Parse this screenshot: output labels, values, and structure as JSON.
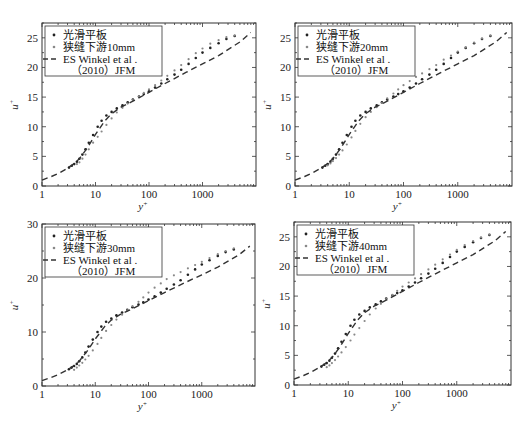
{
  "chart_data": [
    {
      "type": "scatter",
      "panel": "top-left",
      "xlabel": "y+",
      "ylabel": "u+",
      "xscale": "log",
      "xlim": [
        1,
        10000
      ],
      "ylim": [
        0,
        27.5
      ],
      "xticks": [
        "1",
        "10",
        "100",
        "1000"
      ],
      "yticks": [
        "0",
        "5",
        "10",
        "15",
        "20",
        "25"
      ],
      "legend": [
        "光滑平板",
        "狭缝下游10mm",
        "ES Winkel et al .",
        "（2010）JFM"
      ],
      "series": [
        {
          "name": "光滑平板",
          "style": "dark-dots",
          "x": [
            3.2,
            3.6,
            4,
            4.5,
            5,
            5.7,
            6.5,
            7.5,
            9,
            11,
            13,
            16,
            20,
            25,
            32,
            40,
            50,
            65,
            80,
            100,
            130,
            170,
            220,
            300,
            400,
            550,
            750,
            1000,
            1400,
            2000,
            2800,
            4000
          ],
          "y": [
            3.1,
            3.4,
            3.7,
            4.1,
            4.6,
            5.3,
            6.2,
            7.3,
            8.6,
            10.0,
            11.0,
            11.9,
            12.5,
            13.1,
            13.6,
            14.1,
            14.6,
            15.1,
            15.5,
            16.0,
            16.6,
            17.3,
            18.0,
            18.8,
            19.6,
            20.6,
            21.6,
            22.5,
            23.3,
            24.1,
            24.8,
            25.3
          ]
        },
        {
          "name": "狭缝下游10mm",
          "style": "gray-dots",
          "x": [
            4.5,
            5,
            5.7,
            6.5,
            7.5,
            9,
            11,
            13,
            16,
            20,
            25,
            32,
            40,
            50,
            65,
            80,
            100,
            130,
            170,
            220,
            300,
            400,
            550,
            750,
            1000,
            1400,
            2000,
            2800,
            4000
          ],
          "y": [
            3.7,
            4.0,
            4.6,
            5.3,
            6.2,
            7.3,
            8.3,
            9.2,
            10.3,
            11.4,
            12.4,
            13.2,
            13.9,
            14.5,
            15.1,
            15.7,
            16.3,
            17.0,
            17.8,
            18.6,
            19.5,
            20.4,
            21.4,
            22.4,
            23.2,
            24.0,
            24.6,
            25.1,
            25.4
          ]
        },
        {
          "name": "ES Winkel et al. (2010) JFM",
          "style": "dashed",
          "x": [
            1,
            1.5,
            2,
            3,
            4,
            5,
            7,
            10,
            15,
            20,
            30,
            50,
            100,
            200,
            500,
            1000,
            2000,
            5000,
            8000
          ],
          "y": [
            1.0,
            1.6,
            2.1,
            3.0,
            3.8,
            4.6,
            6.4,
            8.7,
            11.0,
            12.2,
            13.3,
            14.3,
            15.8,
            17.3,
            19.2,
            20.6,
            22.0,
            24.3,
            25.9
          ]
        }
      ]
    },
    {
      "type": "scatter",
      "panel": "top-right",
      "xlabel": "y+",
      "ylabel": "u+",
      "xscale": "log",
      "xlim": [
        1,
        10000
      ],
      "ylim": [
        0,
        27.5
      ],
      "xticks": [
        "1",
        "10",
        "100",
        "1000"
      ],
      "yticks": [
        "0",
        "5",
        "10",
        "15",
        "20",
        "25"
      ],
      "legend": [
        "光滑平板",
        "狭缝下游20mm",
        "ES Winkel et al .",
        "（2010）JFM"
      ],
      "series": [
        {
          "name": "光滑平板",
          "style": "dark-dots",
          "x": [
            3.2,
            3.6,
            4,
            4.5,
            5,
            5.7,
            6.5,
            7.5,
            9,
            11,
            13,
            16,
            20,
            25,
            32,
            40,
            50,
            65,
            80,
            100,
            130,
            170,
            220,
            300,
            400,
            550,
            750,
            1000,
            1400,
            2000,
            2800,
            4000
          ],
          "y": [
            3.1,
            3.4,
            3.7,
            4.1,
            4.6,
            5.3,
            6.2,
            7.3,
            8.6,
            10.0,
            11.0,
            11.9,
            12.5,
            13.1,
            13.6,
            14.1,
            14.6,
            15.1,
            15.5,
            16.0,
            16.6,
            17.3,
            18.0,
            18.8,
            19.6,
            20.6,
            21.6,
            22.5,
            23.3,
            24.1,
            24.8,
            25.3
          ]
        },
        {
          "name": "狭缝下游20mm",
          "style": "gray-dots",
          "x": [
            4,
            4.5,
            5,
            5.7,
            6.5,
            7.5,
            9,
            11,
            13,
            16,
            20,
            25,
            32,
            40,
            50,
            65,
            80,
            100,
            130,
            170,
            220,
            300,
            400,
            550,
            750,
            1000,
            1400,
            2000,
            2800,
            4000
          ],
          "y": [
            3.5,
            3.8,
            4.2,
            4.7,
            5.3,
            6.0,
            7.0,
            8.2,
            9.3,
            10.5,
            11.6,
            12.5,
            13.3,
            14.0,
            14.8,
            15.6,
            16.3,
            17.0,
            17.7,
            18.4,
            19.0,
            19.7,
            20.4,
            21.3,
            22.0,
            22.7,
            23.4,
            24.2,
            24.9,
            25.4
          ]
        },
        {
          "name": "ES Winkel et al. (2010) JFM",
          "style": "dashed",
          "x": [
            1,
            1.5,
            2,
            3,
            4,
            5,
            7,
            10,
            15,
            20,
            30,
            50,
            100,
            200,
            500,
            1000,
            2000,
            5000,
            8000
          ],
          "y": [
            1.0,
            1.6,
            2.1,
            3.0,
            3.8,
            4.6,
            6.4,
            8.7,
            11.0,
            12.2,
            13.3,
            14.3,
            15.8,
            17.3,
            19.2,
            20.6,
            22.0,
            24.3,
            25.9
          ]
        }
      ]
    },
    {
      "type": "scatter",
      "panel": "bottom-left",
      "xlabel": "y+",
      "ylabel": "u+",
      "xscale": "log",
      "xlim": [
        1,
        10000
      ],
      "ylim": [
        0,
        30
      ],
      "xticks": [
        "1",
        "10",
        "100",
        "1000"
      ],
      "yticks": [
        "0",
        "10",
        "20",
        "30"
      ],
      "legend": [
        "光滑平板",
        "狭缝下游30mm",
        "ES Winkel et al .",
        "（2010）JFM"
      ],
      "series": [
        {
          "name": "光滑平板",
          "style": "dark-dots",
          "x": [
            3.2,
            3.6,
            4,
            4.5,
            5,
            5.7,
            6.5,
            7.5,
            9,
            11,
            13,
            16,
            20,
            25,
            32,
            40,
            50,
            65,
            80,
            100,
            130,
            170,
            220,
            300,
            400,
            550,
            750,
            1000,
            1400,
            2000,
            2800,
            4000
          ],
          "y": [
            3.1,
            3.4,
            3.7,
            4.1,
            4.6,
            5.3,
            6.2,
            7.3,
            8.6,
            10.0,
            11.0,
            11.9,
            12.5,
            13.1,
            13.6,
            14.1,
            14.6,
            15.1,
            15.5,
            16.0,
            16.6,
            17.3,
            18.0,
            18.8,
            19.6,
            20.6,
            21.6,
            22.5,
            23.3,
            24.1,
            24.8,
            25.3
          ]
        },
        {
          "name": "狭缝下游30mm",
          "style": "gray-dots",
          "x": [
            4,
            4.5,
            5,
            5.7,
            6.5,
            7.5,
            9,
            11,
            13,
            16,
            20,
            25,
            32,
            40,
            50,
            65,
            80,
            100,
            130,
            170,
            220,
            300,
            400,
            550,
            750,
            1000,
            1400,
            2000,
            2800,
            4000
          ],
          "y": [
            3.0,
            3.4,
            3.8,
            4.3,
            4.9,
            5.6,
            6.6,
            7.8,
            8.9,
            10.2,
            11.3,
            12.3,
            13.2,
            14.0,
            14.8,
            15.6,
            16.4,
            17.3,
            18.2,
            19.0,
            19.8,
            20.5,
            21.1,
            21.8,
            22.4,
            23.0,
            23.7,
            24.4,
            25.0,
            25.5
          ]
        },
        {
          "name": "ES Winkel et al. (2010) JFM",
          "style": "dashed",
          "x": [
            1,
            1.5,
            2,
            3,
            4,
            5,
            7,
            10,
            15,
            20,
            30,
            50,
            100,
            200,
            500,
            1000,
            2000,
            5000,
            8000
          ],
          "y": [
            1.0,
            1.6,
            2.1,
            3.0,
            3.8,
            4.6,
            6.4,
            8.7,
            11.0,
            12.2,
            13.3,
            14.3,
            15.8,
            17.3,
            19.2,
            20.6,
            22.0,
            24.3,
            25.9
          ]
        }
      ]
    },
    {
      "type": "scatter",
      "panel": "bottom-right",
      "xlabel": "y+",
      "ylabel": "u+",
      "xscale": "log",
      "xlim": [
        1,
        10000
      ],
      "ylim": [
        0,
        27.5
      ],
      "xticks": [
        "1",
        "10",
        "100",
        "1000"
      ],
      "yticks": [
        "0",
        "5",
        "10",
        "15",
        "20",
        "25"
      ],
      "legend": [
        "光滑平板",
        "狭缝下游40mm",
        "ES Winkel et al .",
        "（2010）JFM"
      ],
      "series": [
        {
          "name": "光滑平板",
          "style": "dark-dots",
          "x": [
            3.2,
            3.6,
            4,
            4.5,
            5,
            5.7,
            6.5,
            7.5,
            9,
            11,
            13,
            16,
            20,
            25,
            32,
            40,
            50,
            65,
            80,
            100,
            130,
            170,
            220,
            300,
            400,
            550,
            750,
            1000,
            1400,
            2000,
            2800,
            4000
          ],
          "y": [
            3.1,
            3.4,
            3.7,
            4.1,
            4.6,
            5.3,
            6.2,
            7.3,
            8.6,
            10.0,
            11.0,
            11.9,
            12.5,
            13.1,
            13.6,
            14.1,
            14.6,
            15.1,
            15.5,
            16.0,
            16.6,
            17.3,
            18.0,
            18.8,
            19.6,
            20.6,
            21.6,
            22.5,
            23.3,
            24.1,
            24.8,
            25.3
          ]
        },
        {
          "name": "狭缝下游40mm",
          "style": "gray-dots",
          "x": [
            4,
            4.5,
            5,
            5.7,
            6.5,
            7.5,
            9,
            11,
            13,
            16,
            20,
            25,
            32,
            40,
            50,
            65,
            80,
            100,
            130,
            170,
            220,
            300,
            400,
            550,
            750,
            1000,
            1400,
            2000,
            2800,
            4000
          ],
          "y": [
            3.0,
            3.3,
            3.7,
            4.2,
            4.8,
            5.5,
            6.4,
            7.5,
            8.5,
            9.6,
            10.8,
            11.9,
            12.9,
            13.7,
            14.5,
            15.2,
            15.9,
            16.6,
            17.3,
            18.0,
            18.7,
            19.5,
            20.3,
            21.2,
            22.0,
            22.8,
            23.6,
            24.3,
            24.9,
            25.4
          ]
        },
        {
          "name": "ES Winkel et al. (2010) JFM",
          "style": "dashed",
          "x": [
            1,
            1.5,
            2,
            3,
            4,
            5,
            7,
            10,
            15,
            20,
            30,
            50,
            100,
            200,
            500,
            1000,
            2000,
            5000,
            8000
          ],
          "y": [
            1.0,
            1.6,
            2.1,
            3.0,
            3.8,
            4.6,
            6.4,
            8.7,
            11.0,
            12.2,
            13.3,
            14.3,
            15.8,
            17.3,
            19.2,
            20.6,
            22.0,
            24.3,
            25.9
          ]
        }
      ]
    }
  ],
  "layout": {
    "panels": [
      {
        "left": 42,
        "right": 256,
        "top": 23,
        "bottom": 186
      },
      {
        "left": 295,
        "right": 512,
        "top": 23,
        "bottom": 186
      },
      {
        "left": 42,
        "right": 255,
        "top": 224,
        "bottom": 386
      },
      {
        "left": 294,
        "right": 511,
        "top": 222,
        "bottom": 385
      }
    ],
    "colors": {
      "frame": "#333333",
      "dark_dots": "#222222",
      "gray_dots": "#888888",
      "dashed": "#333333"
    }
  }
}
